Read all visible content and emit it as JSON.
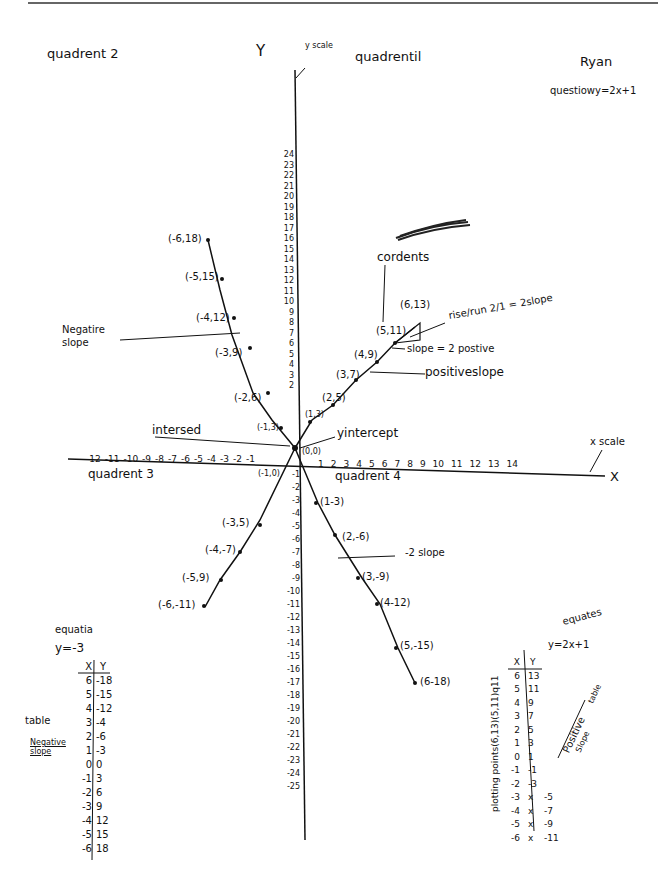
{
  "header": {
    "quadrant2_label": "quadrent 2",
    "y_axis_letter": "Y",
    "y_scale_label": "y scale",
    "quadrant1_label": "quadrentil",
    "author": "Ryan",
    "question": "questiowy=2x+1"
  },
  "annotations": {
    "scribble": "(scribbled out)",
    "coordinates_label": "cordents",
    "rise_run": "rise/run 2/1 = 2slope",
    "slope_positive": "slope = 2 postive",
    "positive_slope": "positiveslope",
    "negative_slope": "Negatire slope",
    "intersect": "intersed",
    "y_intercept": "yintercept",
    "x_scale": "x scale",
    "x_axis_letter": "X",
    "quadrant3_label": "quadrent 3",
    "quadrant4_label": "quadrent 4",
    "neg2_slope": "-2 slope"
  },
  "points": {
    "q2": [
      "(-6,18)",
      "(-5,15)",
      "(-4,12)",
      "(-3,9)",
      "(-2,6)",
      "(-1,3)"
    ],
    "q1": [
      "(1,3)",
      "(2,5)",
      "(3,7)",
      "(4,9)",
      "(5,11)",
      "(6,13)"
    ],
    "origin": "(0,0)",
    "q3": [
      "(-1,0)",
      "(-3,5)",
      "(-4,-7)",
      "(-5,9)",
      "(-6,-11)"
    ],
    "q4": [
      "(1-3)",
      "(2,-6)",
      "(3,-9)",
      "(4-12)",
      "(5,-15)",
      "(6-18)"
    ]
  },
  "y_ticks_pos": [
    "24",
    "23",
    "22",
    "21",
    "20",
    "19",
    "18",
    "17",
    "16",
    "15",
    "14",
    "13",
    "12",
    "11",
    "10",
    "9",
    "8",
    "7",
    "6",
    "5",
    "4",
    "3",
    "2"
  ],
  "y_ticks_neg": [
    "-1",
    "-2",
    "-3",
    "-4",
    "-5",
    "-6",
    "-7",
    "-8",
    "-9",
    "-10",
    "-11",
    "-12",
    "-13",
    "-14",
    "-15",
    "-16",
    "-17",
    "-18",
    "-19",
    "-20",
    "-21",
    "-22",
    "-23",
    "-24",
    "-25"
  ],
  "x_ticks_neg": [
    "-12",
    "-11",
    "-10",
    "-9",
    "-8",
    "-7",
    "-6",
    "-5",
    "-4",
    "-3",
    "-2",
    "-1"
  ],
  "x_ticks_pos": [
    "1",
    "2",
    "3",
    "4",
    "5",
    "6",
    "7",
    "8",
    "9",
    "10",
    "11",
    "12",
    "13",
    "14"
  ],
  "left_table": {
    "title": "equatia",
    "equation": "y=-3",
    "side_label": "table",
    "side_sublabel": "Negative slope",
    "headers": [
      "X",
      "Y"
    ],
    "x": [
      "6",
      "5",
      "4",
      "3",
      "2",
      "1",
      "0",
      "-1",
      "-2",
      "-3",
      "-4",
      "-5",
      "-6"
    ],
    "y": [
      "-18",
      "-15",
      "-12",
      "-4",
      "-6",
      "-3",
      "0",
      "3",
      "6",
      "9",
      "12",
      "15",
      "18"
    ]
  },
  "right_table": {
    "title": "equates",
    "equation": "y=2x+1",
    "side_label_vertical": "plotting points(6,13)(5,11)q11",
    "positive_label": "Positive",
    "slope_label": "Slope",
    "table_label": "table",
    "headers": [
      "X",
      "Y"
    ],
    "x": [
      "6",
      "5",
      "4",
      "3",
      "2",
      "1",
      "0",
      "-1",
      "-2",
      "-3",
      "-4",
      "-5",
      "-6"
    ],
    "y": [
      "13",
      "11",
      "9",
      "7",
      "5",
      "3",
      "1",
      "-1",
      "-3",
      "x",
      "x",
      "x",
      "x"
    ],
    "y_corrected": [
      "",
      "",
      "",
      "",
      "",
      "",
      "",
      "",
      "",
      "-5",
      "-7",
      "-9",
      "-11"
    ]
  }
}
